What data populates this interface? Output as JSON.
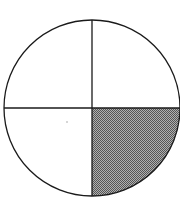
{
  "diagram": {
    "type": "fraction-circle",
    "parts": 4,
    "shaded_parts": 1,
    "shaded_quadrant": "bottom-right",
    "colors": {
      "stroke": "#1a1a1a",
      "fill": "#ffffff",
      "shade": "#8a8a8a"
    }
  }
}
